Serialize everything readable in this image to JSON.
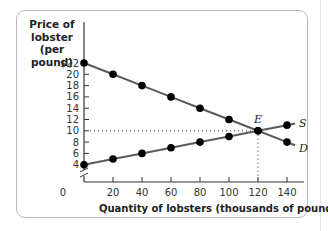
{
  "chart_data": {
    "type": "line",
    "title": "",
    "ylabel": "Price of lobster (per pound)",
    "xlabel": "Quantity of lobsters (thousands of pounds)",
    "x": [
      0,
      20,
      40,
      60,
      80,
      100,
      120,
      140
    ],
    "series": [
      {
        "name": "D",
        "label": "Demand",
        "values": [
          22,
          20,
          18,
          16,
          14,
          12,
          10,
          8
        ]
      },
      {
        "name": "S",
        "label": "Supply",
        "values": [
          4,
          5,
          6,
          7,
          8,
          9,
          10,
          11
        ]
      }
    ],
    "equilibrium": {
      "label": "E",
      "x": 120,
      "y": 10
    },
    "x_ticks": [
      "0",
      "20",
      "40",
      "60",
      "80",
      "100",
      "120",
      "140"
    ],
    "y_ticks": [
      "$22",
      "20",
      "18",
      "16",
      "14",
      "12",
      "10",
      "8",
      "6",
      "4"
    ],
    "xlim": [
      0,
      150
    ],
    "ylim": [
      0,
      22
    ],
    "y_axis_break": true,
    "grid": false,
    "legend": "inline labels at line ends",
    "colors": {
      "lines": "#5a5a5a",
      "points": "#000000",
      "axes": "#333333",
      "frame": "#b9b9b9"
    }
  },
  "labels": {
    "y_axis_line1": "Price of",
    "y_axis_line2": "lobster",
    "y_axis_line3": "(per pound)",
    "x_axis": "Quantity of lobsters (thousands of pounds)",
    "supply": "S",
    "demand": "D",
    "equilibrium": "E",
    "origin": "0"
  }
}
